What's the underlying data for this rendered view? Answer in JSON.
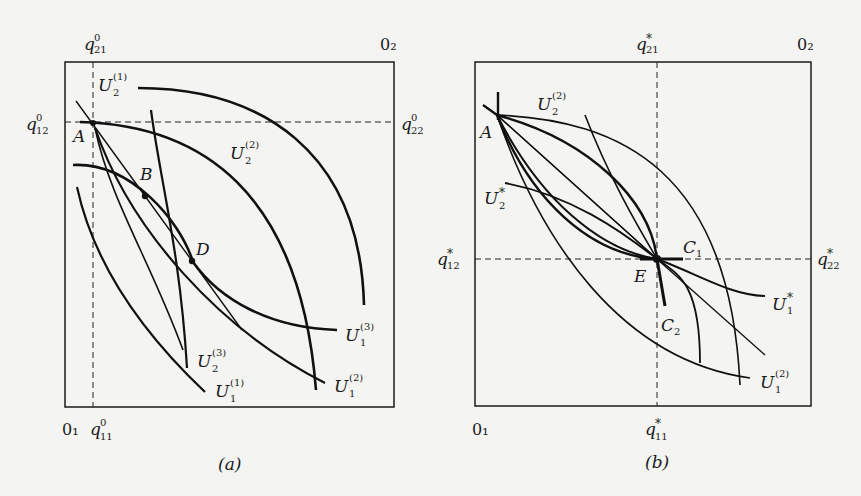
{
  "figure": {
    "panel_a": {
      "caption": "(a)",
      "corner_origin_1": "0₁",
      "corner_origin_2": "0₂",
      "axis_labels": {
        "q21": {
          "base": "q",
          "sub": "21",
          "sup": "0"
        },
        "q12": {
          "base": "q",
          "sub": "12",
          "sup": "0"
        },
        "q22": {
          "base": "q",
          "sub": "22",
          "sup": "0"
        },
        "q11": {
          "base": "q",
          "sub": "11",
          "sup": "0"
        }
      },
      "points": [
        {
          "name": "A"
        },
        {
          "name": "B"
        },
        {
          "name": "D"
        }
      ],
      "curve_labels": {
        "U2_1": {
          "base": "U",
          "sub": "2",
          "sup": "(1)"
        },
        "U2_2": {
          "base": "U",
          "sub": "2",
          "sup": "(2)"
        },
        "U2_3": {
          "base": "U",
          "sub": "2",
          "sup": "(3)"
        },
        "U1_1": {
          "base": "U",
          "sub": "1",
          "sup": "(1)"
        },
        "U1_2": {
          "base": "U",
          "sub": "1",
          "sup": "(2)"
        },
        "U1_3": {
          "base": "U",
          "sub": "1",
          "sup": "(3)"
        }
      }
    },
    "panel_b": {
      "caption": "(b)",
      "corner_origin_1": "0₁",
      "corner_origin_2": "0₂",
      "axis_labels": {
        "q21": {
          "base": "q",
          "sub": "21",
          "sup": "*"
        },
        "q12": {
          "base": "q",
          "sub": "12",
          "sup": "*"
        },
        "q22": {
          "base": "q",
          "sub": "22",
          "sup": "*"
        },
        "q11": {
          "base": "q",
          "sub": "11",
          "sup": "*"
        }
      },
      "points": [
        {
          "name": "A"
        },
        {
          "name": "E"
        }
      ],
      "curve_labels": {
        "U2_2": {
          "base": "U",
          "sub": "2",
          "sup": "(2)"
        },
        "U2_star": {
          "base": "U",
          "sub": "2",
          "sup": "*"
        },
        "U1_star": {
          "base": "U",
          "sub": "1",
          "sup": "*"
        },
        "U1_2": {
          "base": "U",
          "sub": "1",
          "sup": "(2)"
        },
        "C1": {
          "base": "C",
          "sub": "1"
        },
        "C2": {
          "base": "C",
          "sub": "2"
        }
      }
    }
  }
}
